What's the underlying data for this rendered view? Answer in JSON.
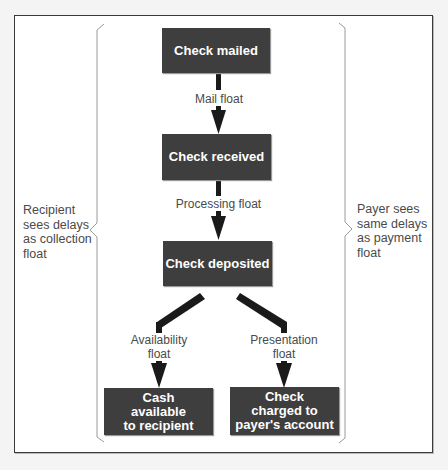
{
  "diagram": {
    "nodes": {
      "check_mailed": "Check mailed",
      "check_received": "Check received",
      "check_deposited": "Check deposited",
      "cash_available": "Cash\navailable\nto recipient",
      "check_charged": "Check\ncharged to\npayer's account"
    },
    "edges": {
      "mail_float": "Mail float",
      "processing_float": "Processing float",
      "availability_float": "Availability\nfloat",
      "presentation_float": "Presentation\nfloat"
    },
    "side_notes": {
      "left": "Recipient\nsees delays\nas collection\nfloat",
      "right": "Payer sees\nsame delays\nas payment\nfloat"
    },
    "colors": {
      "box_fill": "#3e3e3e",
      "box_text": "#ffffff",
      "arrow": "#1a1a1a",
      "label_text": "#4a4a4a",
      "bracket": "#9a9a9a"
    }
  }
}
